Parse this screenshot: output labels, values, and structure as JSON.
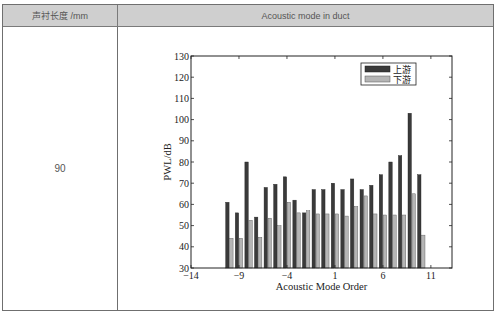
{
  "table": {
    "headers": [
      "声衬长度 /mm",
      "Acoustic mode in duct"
    ],
    "rows": [
      {
        "length_mm": "90"
      }
    ]
  },
  "colors": {
    "header_bg": "#cfcfcf",
    "upstream_bar": "#3a3a3a",
    "downstream_bar": "#b5b5b5"
  },
  "chart_data": {
    "type": "bar",
    "title": "",
    "xlabel": "Acoustic Mode Order",
    "ylabel": "PWL/dB",
    "xlim": [
      -14,
      13.2
    ],
    "ylim": [
      30,
      130
    ],
    "xticks": [
      -14,
      -9,
      -4,
      1,
      6,
      11
    ],
    "yticks": [
      30,
      40,
      50,
      60,
      70,
      80,
      90,
      100,
      110,
      120,
      130
    ],
    "grid": false,
    "legend_position": "upper right",
    "categories": [
      -10,
      -9,
      -8,
      -7,
      -6,
      -5,
      -4,
      -3,
      -2,
      -1,
      0,
      1,
      2,
      3,
      4,
      5,
      6,
      7,
      8,
      9,
      10
    ],
    "series": [
      {
        "name": "上游",
        "values": [
          61,
          56,
          80,
          54,
          68,
          69.5,
          73,
          62,
          56,
          67,
          67,
          70,
          67,
          72,
          67,
          69,
          74,
          80,
          83,
          103,
          74
        ]
      },
      {
        "name": "下游",
        "values": [
          44,
          44,
          52.5,
          44.5,
          53.5,
          50,
          61,
          56,
          57,
          55.5,
          55.5,
          55.5,
          54.5,
          59,
          64,
          55.5,
          55,
          55,
          55,
          65,
          45.5
        ]
      }
    ]
  }
}
